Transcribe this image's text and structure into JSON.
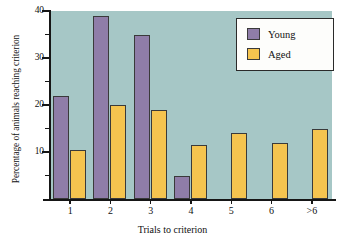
{
  "chart_data": {
    "type": "bar",
    "title": "",
    "xlabel": "Trials to criterion",
    "ylabel": "Percentage of animals reaching criterion",
    "categories": [
      "1",
      "2",
      "3",
      "4",
      "5",
      "6",
      ">6"
    ],
    "series": [
      {
        "name": "Young",
        "color": "#8f7da8",
        "values": [
          22,
          39,
          35,
          5,
          0,
          0,
          0
        ]
      },
      {
        "name": "Aged",
        "color": "#f5c44f",
        "values": [
          10.5,
          20,
          19,
          11.5,
          14,
          12,
          15
        ]
      }
    ],
    "ylim": [
      0,
      40
    ],
    "ytick_labels": [
      "40",
      "30",
      "20",
      "10"
    ],
    "ytick_values": [
      40,
      30,
      20,
      10
    ],
    "yminor_values": [
      35,
      25,
      15,
      5
    ],
    "grid": false,
    "legend_position": "top-right",
    "plot_background": "#a6c7c6",
    "axis_color": "#161616"
  },
  "legend": {
    "entries": [
      {
        "label": "Young",
        "color": "#8f7da8"
      },
      {
        "label": "Aged",
        "color": "#f5c44f"
      }
    ]
  },
  "axes": {
    "y_title": "Percentage of animals reaching criterion",
    "x_title": "Trials to criterion",
    "y_labels": [
      "40",
      "30",
      "20",
      "10"
    ],
    "x_labels": [
      "1",
      "2",
      "3",
      "4",
      "5",
      "6",
      ">6"
    ]
  }
}
